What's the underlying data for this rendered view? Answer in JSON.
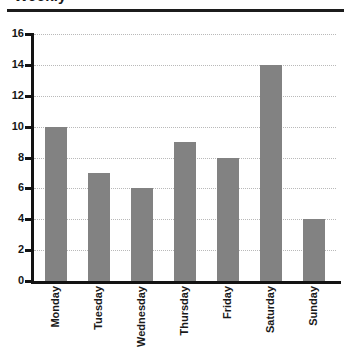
{
  "chart_data": {
    "type": "bar",
    "title": "Weekly",
    "categories": [
      "Monday",
      "Tuesday",
      "Wednesday",
      "Thursday",
      "Friday",
      "Saturday",
      "Sunday"
    ],
    "values": [
      10,
      7,
      6,
      9,
      8,
      14,
      4
    ],
    "xlabel": "",
    "ylabel": "",
    "ylim": [
      0,
      16
    ],
    "ytick_step": 2,
    "yticks": [
      0,
      2,
      4,
      6,
      8,
      10,
      12,
      14,
      16
    ],
    "ytick_labels": [
      "0",
      "2",
      "4",
      "6",
      "8",
      "10",
      "12",
      "14",
      "16"
    ],
    "grid": true,
    "grid_axis": "y",
    "grid_style": "dotted",
    "legend": false,
    "legend_position": "none",
    "bar_color": "#828282",
    "axis_color": "#131313",
    "grid_color": "#b9b9b9",
    "text_color": "#1a1a1a",
    "xtick_rotation": 90
  }
}
